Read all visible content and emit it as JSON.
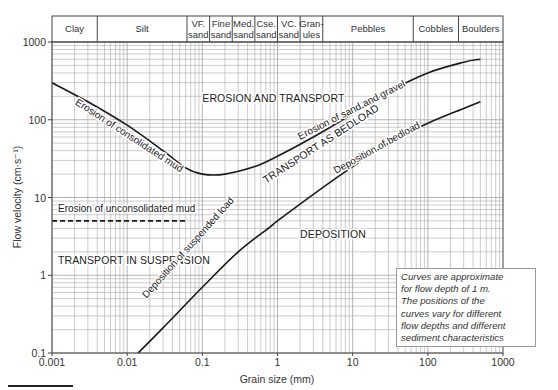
{
  "chart_data": {
    "type": "line",
    "title": "",
    "xlabel": "Grain size (mm)",
    "ylabel": "Flow velocity (cm·s⁻¹)",
    "xscale": "log",
    "yscale": "log",
    "xlim": [
      0.001,
      1000
    ],
    "ylim": [
      0.1,
      1000
    ],
    "grid": true,
    "x_tick_labels": [
      "0.001",
      "0.01",
      "0.1",
      "1",
      "10",
      "100",
      "1000"
    ],
    "y_tick_labels": [
      "0.1",
      "1",
      "10",
      "100",
      "1000"
    ],
    "grain_classes": [
      {
        "label": "Clay",
        "from": 0.001,
        "to": 0.004
      },
      {
        "label": "Silt",
        "from": 0.004,
        "to": 0.0625
      },
      {
        "label": "VF. sand",
        "from": 0.0625,
        "to": 0.125
      },
      {
        "label": "Fine sand",
        "from": 0.125,
        "to": 0.25
      },
      {
        "label": "Med. sand",
        "from": 0.25,
        "to": 0.5
      },
      {
        "label": "Cse. sand",
        "from": 0.5,
        "to": 1
      },
      {
        "label": "VC. sand",
        "from": 1,
        "to": 2
      },
      {
        "label": "Gran-ules",
        "from": 2,
        "to": 4
      },
      {
        "label": "Pebbles",
        "from": 4,
        "to": 64
      },
      {
        "label": "Cobbles",
        "from": 64,
        "to": 256
      },
      {
        "label": "Boulders",
        "from": 256,
        "to": 1000
      }
    ],
    "series": [
      {
        "name": "Erosion curve (consolidated mud / sand and gravel)",
        "style": "solid",
        "x": [
          0.001,
          0.003,
          0.01,
          0.03,
          0.06,
          0.1,
          0.2,
          0.5,
          1,
          3,
          10,
          30,
          100,
          300,
          500
        ],
        "y": [
          300,
          170,
          85,
          40,
          24,
          20,
          20,
          25,
          34,
          60,
          120,
          230,
          400,
          550,
          600
        ]
      },
      {
        "name": "Deposition of suspended load / bedload",
        "style": "solid",
        "x": [
          0.014,
          0.03,
          0.1,
          0.3,
          0.8,
          1,
          3,
          10,
          30,
          100,
          300,
          500
        ],
        "y": [
          0.1,
          0.21,
          0.7,
          2.0,
          4.2,
          5.0,
          11,
          25,
          50,
          90,
          140,
          170
        ]
      },
      {
        "name": "Erosion of unconsolidated mud",
        "style": "dashed",
        "x": [
          0.001,
          0.06
        ],
        "y": [
          5,
          5
        ]
      }
    ],
    "annotations": [
      {
        "text": "Erosion of consolidated mud",
        "x": 0.002,
        "y": 160,
        "rotation": 33
      },
      {
        "text": "EROSION AND TRANSPORT",
        "x": 0.1,
        "y": 170,
        "rotation": 0
      },
      {
        "text": "Erosion of sand and gravel",
        "x": 2,
        "y": 55,
        "rotation": -27
      },
      {
        "text": "TRANSPORT AS BEDLOAD",
        "x": 0.7,
        "y": 15,
        "rotation": -33
      },
      {
        "text": "Deposition of bedload",
        "x": 6,
        "y": 20,
        "rotation": -29
      },
      {
        "text": "Erosion of unconsolidated mud",
        "x": 0.0012,
        "y": 6.5,
        "rotation": 0
      },
      {
        "text": "TRANSPORT IN SUSPENSION",
        "x": 0.0012,
        "y": 1.4,
        "rotation": 0
      },
      {
        "text": "Deposition of suspended load",
        "x": 0.018,
        "y": 0.5,
        "rotation": -48
      },
      {
        "text": "DEPOSITION",
        "x": 2,
        "y": 3,
        "rotation": 0
      }
    ],
    "note": "Curves are approximate for flow depth of 1 m. The positions of the curves vary for different flow depths and different sediment characteristics"
  },
  "note_lines": [
    "Curves are approximate",
    "for flow depth of 1 m.",
    "The positions of the",
    "curves vary for different",
    "flow depths and different",
    "sediment characteristics"
  ]
}
